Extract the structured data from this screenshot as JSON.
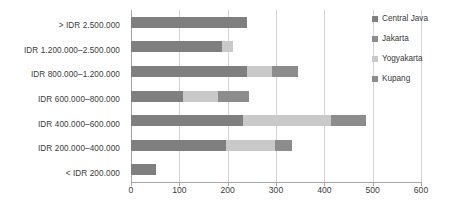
{
  "chart_data": {
    "type": "bar",
    "orientation": "horizontal",
    "stacked": true,
    "title": "",
    "xlabel": "",
    "ylabel": "",
    "xlim": [
      0,
      600
    ],
    "grid": true,
    "legend_position": "right",
    "xticks": [
      0,
      100,
      200,
      300,
      400,
      500,
      600
    ],
    "xtick_labels": [
      "0",
      "100",
      "200",
      "300",
      "400",
      "500",
      "600"
    ],
    "categories": [
      "> IDR 2.500.000",
      "IDR 1.200.000–2.500.000",
      "IDR 800.000–1.200.000",
      "IDR 600.000–800.000",
      "IDR 400.000–600.000",
      "IDR 200.000–400.000",
      "< IDR 200.000"
    ],
    "series": [
      {
        "name": "Central Java",
        "color": "#7f7f7f",
        "values": [
          240,
          188,
          240,
          108,
          232,
          197,
          52
        ]
      },
      {
        "name": "Jakarta",
        "color": "#8c8c8c",
        "values": [
          0,
          0,
          0,
          0,
          0,
          0,
          0
        ]
      },
      {
        "name": "Yogyakarta",
        "color": "#c9c9c9",
        "values": [
          0,
          24,
          52,
          72,
          182,
          101,
          0
        ]
      },
      {
        "name": "Kupang",
        "color": "#8c8c8c",
        "values": [
          0,
          0,
          53,
          65,
          72,
          35,
          0
        ]
      }
    ]
  },
  "legend": {
    "items": [
      {
        "label": "Central Java",
        "color": "#7f7f7f"
      },
      {
        "label": "Jakarta",
        "color": "#8c8c8c"
      },
      {
        "label": "Yogyakarta",
        "color": "#c9c9c9"
      },
      {
        "label": "Kupang",
        "color": "#8c8c8c"
      }
    ]
  }
}
